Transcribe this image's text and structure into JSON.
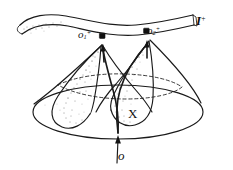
{
  "figure": {
    "kind": "hand-drawn-spacetime-diagram",
    "background_color": "#ffffff",
    "ink_color": "#1a1a1a",
    "width": 233,
    "height": 170
  },
  "labels": {
    "null_infinity": {
      "symbol": "I",
      "superscript": "+",
      "name": "scri-plus"
    },
    "point_o1": {
      "base": "o",
      "subscript": "1",
      "superscript": "+"
    },
    "point_o2": {
      "base": "o",
      "subscript": "2",
      "superscript": "+"
    },
    "region_x": "X",
    "origin": "o"
  },
  "elements": {
    "ribbon": "null-infinity-ribbon",
    "big_cone": "outer-light-cone",
    "horizon_ellipse": "dashed-horizon-circle",
    "left_cone": "left-past-light-cone",
    "right_cone": "right-past-light-cone",
    "geodesic_left": "null-geodesic-to-o1",
    "geodesic_right": "null-geodesic-to-o2",
    "origin_arrow": "origin-arrow"
  }
}
